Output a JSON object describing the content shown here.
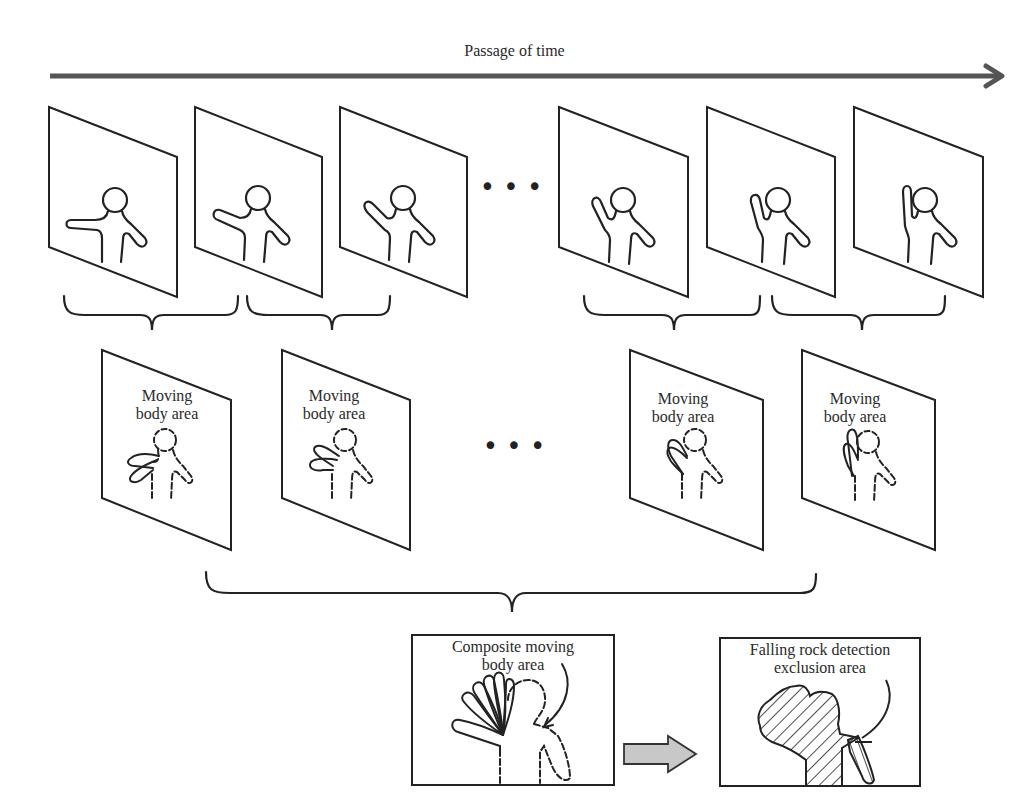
{
  "diagram": {
    "timeline": {
      "label": "Passage of time",
      "direction": "left-to-right"
    },
    "input_frames": {
      "count_visible": 6,
      "ellipsis": "• • •",
      "poses": [
        "arm-horizontal",
        "arm-slightly-raised",
        "arm-raised-45",
        "arm-raised-60",
        "arm-raised-75",
        "arm-vertical"
      ]
    },
    "moving_body_frames": {
      "count_visible": 4,
      "ellipsis": "• • •",
      "items": [
        {
          "label_line1": "Moving",
          "label_line2": "body area"
        },
        {
          "label_line1": "Moving",
          "label_line2": "body area"
        },
        {
          "label_line1": "Moving",
          "label_line2": "body area"
        },
        {
          "label_line1": "Moving",
          "label_line2": "body area"
        }
      ]
    },
    "composite_box": {
      "label_line1": "Composite moving",
      "label_line2": "body area"
    },
    "exclusion_box": {
      "label_line1": "Falling rock detection",
      "label_line2": "exclusion area"
    },
    "colors": {
      "line": "#222222",
      "arrow_fill": "#c8c8c8",
      "timeline": "#555555",
      "background": "#ffffff"
    }
  }
}
